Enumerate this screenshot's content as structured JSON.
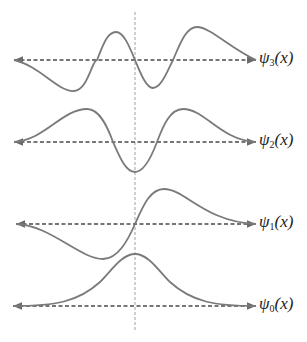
{
  "diagram": {
    "type": "quantum harmonic oscillator wavefunctions",
    "colors": {
      "curve": "#7a7a7a",
      "axis": "#4a4a4a",
      "center_line": "#9a9a9a",
      "text": "#222222"
    },
    "center_x": 135,
    "center_line": {
      "y1": 12,
      "y2": 331
    },
    "axis_x_range": [
      13,
      256
    ],
    "levels": [
      {
        "id": "psi3",
        "symbol": "ψ",
        "subscript": "3",
        "arg": "(x)",
        "axis_y": 60
      },
      {
        "id": "psi2",
        "symbol": "ψ",
        "subscript": "2",
        "arg": "(x)",
        "axis_y": 142
      },
      {
        "id": "psi1",
        "symbol": "ψ",
        "subscript": "1",
        "arg": "(x)",
        "axis_y": 224
      },
      {
        "id": "psi0",
        "symbol": "ψ",
        "subscript": "0",
        "arg": "(x)",
        "axis_y": 306
      }
    ]
  }
}
